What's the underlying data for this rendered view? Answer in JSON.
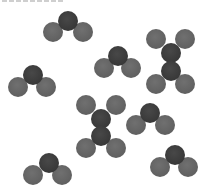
{
  "figure": {
    "atom_radius": 10,
    "colors": {
      "central_atom": "#3e3e3e",
      "outer_atom": "#676767",
      "background": "#ffffff"
    },
    "molecules": [
      {
        "type": "bent-triatomic",
        "atoms": [
          {
            "role": "outer",
            "x": 53,
            "y": 32
          },
          {
            "role": "outer",
            "x": 83,
            "y": 32
          },
          {
            "role": "central",
            "x": 68,
            "y": 21
          }
        ]
      },
      {
        "type": "bent-triatomic",
        "atoms": [
          {
            "role": "outer",
            "x": 104,
            "y": 68
          },
          {
            "role": "outer",
            "x": 131,
            "y": 68
          },
          {
            "role": "central",
            "x": 118,
            "y": 56
          }
        ]
      },
      {
        "type": "bent-triatomic",
        "atoms": [
          {
            "role": "outer",
            "x": 18,
            "y": 87
          },
          {
            "role": "outer",
            "x": 46,
            "y": 87
          },
          {
            "role": "central",
            "x": 33,
            "y": 75
          }
        ]
      },
      {
        "type": "bent-triatomic",
        "atoms": [
          {
            "role": "outer",
            "x": 136,
            "y": 125
          },
          {
            "role": "outer",
            "x": 165,
            "y": 125
          },
          {
            "role": "central",
            "x": 150,
            "y": 113
          }
        ]
      },
      {
        "type": "bent-triatomic",
        "atoms": [
          {
            "role": "outer",
            "x": 160,
            "y": 167
          },
          {
            "role": "outer",
            "x": 188,
            "y": 167
          },
          {
            "role": "central",
            "x": 175,
            "y": 155
          }
        ]
      },
      {
        "type": "bent-triatomic",
        "atoms": [
          {
            "role": "outer",
            "x": 33,
            "y": 175
          },
          {
            "role": "outer",
            "x": 62,
            "y": 175
          },
          {
            "role": "central",
            "x": 49,
            "y": 163
          }
        ]
      },
      {
        "type": "ethylene-like",
        "atoms": [
          {
            "role": "outer",
            "x": 156,
            "y": 39
          },
          {
            "role": "outer",
            "x": 185,
            "y": 39
          },
          {
            "role": "outer",
            "x": 156,
            "y": 84
          },
          {
            "role": "outer",
            "x": 185,
            "y": 84
          },
          {
            "role": "central",
            "x": 171,
            "y": 53
          },
          {
            "role": "central",
            "x": 171,
            "y": 71
          }
        ]
      },
      {
        "type": "ethylene-like",
        "atoms": [
          {
            "role": "outer",
            "x": 86,
            "y": 105
          },
          {
            "role": "outer",
            "x": 116,
            "y": 105
          },
          {
            "role": "outer",
            "x": 86,
            "y": 148
          },
          {
            "role": "outer",
            "x": 116,
            "y": 148
          },
          {
            "role": "central",
            "x": 101,
            "y": 119
          },
          {
            "role": "central",
            "x": 101,
            "y": 136
          }
        ]
      }
    ]
  }
}
